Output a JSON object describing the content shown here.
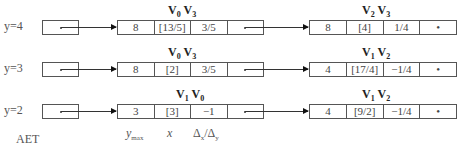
{
  "diagram": {
    "type": "active-edge-table",
    "footer_label": "AET",
    "field_labels": {
      "ymax": "y",
      "ymax_sub": "max",
      "x": "x",
      "dx": "Δ",
      "dx_sub": "x",
      "slash": "/Δ",
      "dy_sub": "y"
    },
    "rows": [
      {
        "label": "y=4",
        "nodes": [
          {
            "title_a": "V",
            "sub_a": "0",
            "title_b": "V",
            "sub_b": "3",
            "cells": [
              "8",
              "[13/5]",
              "3/5",
              ""
            ]
          },
          {
            "title_a": "V",
            "sub_a": "2",
            "title_b": "V",
            "sub_b": "3",
            "cells": [
              "8",
              "[4]",
              "1/4",
              "•"
            ]
          }
        ]
      },
      {
        "label": "y=3",
        "nodes": [
          {
            "title_a": "V",
            "sub_a": "0",
            "title_b": "V",
            "sub_b": "3",
            "cells": [
              "8",
              "[2]",
              "3/5",
              ""
            ]
          },
          {
            "title_a": "V",
            "sub_a": "1",
            "title_b": "V",
            "sub_b": "2",
            "cells": [
              "4",
              "[17/4]",
              "−1/4",
              "•"
            ]
          }
        ]
      },
      {
        "label": "y=2",
        "nodes": [
          {
            "title_a": "V",
            "sub_a": "1",
            "title_b": "V",
            "sub_b": "0",
            "cells": [
              "3",
              "[3]",
              "−1",
              ""
            ]
          },
          {
            "title_a": "V",
            "sub_a": "1",
            "title_b": "V",
            "sub_b": "2",
            "cells": [
              "4",
              "[9/2]",
              "−1/4",
              "•"
            ]
          }
        ]
      }
    ]
  }
}
